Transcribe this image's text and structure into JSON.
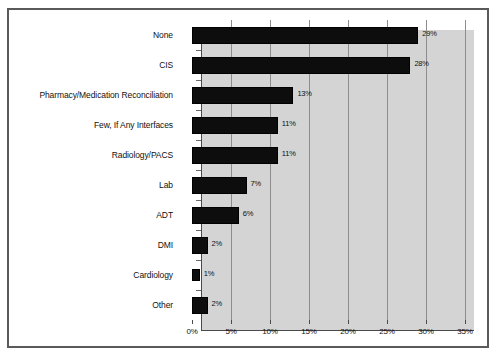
{
  "chart_data": {
    "type": "bar",
    "orientation": "horizontal",
    "title": "",
    "xlabel": "",
    "ylabel": "",
    "xlim": [
      0,
      35
    ],
    "xtick_labels": [
      "0%",
      "5%",
      "10%",
      "15%",
      "20%",
      "25%",
      "30%",
      "35%"
    ],
    "xtick_values": [
      0,
      5,
      10,
      15,
      20,
      25,
      30,
      35
    ],
    "grid": "vertical",
    "legend": "none",
    "categories": [
      "None",
      "CIS",
      "Pharmacy/Medication Reconciliation",
      "Few, If Any Interfaces",
      "Radiology/PACS",
      "Lab",
      "ADT",
      "DMI",
      "Cardiology",
      "Other"
    ],
    "values": [
      29,
      28,
      13,
      11,
      11,
      7,
      6,
      2,
      1,
      2
    ],
    "data_labels": [
      "29%",
      "28%",
      "13%",
      "11%",
      "11%",
      "7%",
      "6%",
      "2%",
      "1%",
      "2%"
    ],
    "bar_color": "#0d0d0d",
    "plot_background": "#d4d4d4",
    "figure_background": "#ffffff"
  }
}
